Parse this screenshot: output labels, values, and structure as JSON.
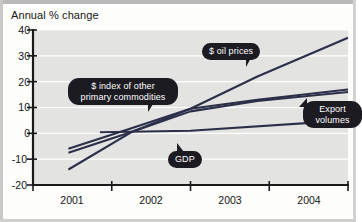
{
  "figure": {
    "title": "Annual % change"
  },
  "chart_data": {
    "type": "line",
    "title": "Annual % change",
    "xlabel": "",
    "ylabel": "Annual % change",
    "ylim": [
      -20,
      40
    ],
    "yticks": [
      -20,
      -10,
      0,
      10,
      20,
      30,
      40
    ],
    "ytick_labels": [
      "-20",
      "-10",
      "0",
      "10",
      "20",
      "30",
      "40"
    ],
    "xlim": [
      2000.75,
      2004.75
    ],
    "xticks": [
      2000.75,
      2001.75,
      2002.75,
      2003.75,
      2004.75
    ],
    "categories": [
      "2001",
      "2002",
      "2003",
      "2004"
    ],
    "xtick_labels": [
      "2001",
      "2002",
      "2003",
      "2004"
    ],
    "grid": true,
    "grid_orientation": "horizontal",
    "legend": "callout-labels",
    "series": [
      {
        "name": "$ oil prices",
        "color": "#2b2f4a",
        "x": [
          2001.2,
          2002.0,
          2002.75,
          2003.6,
          2004.75
        ],
        "values": [
          -14.0,
          0.5,
          9.5,
          22.0,
          37.0
        ]
      },
      {
        "name": "$ index of other primary commodities",
        "color": "#2b2f4a",
        "x": [
          2001.2,
          2002.0,
          2002.75,
          2003.6,
          2004.75
        ],
        "values": [
          -6.0,
          2.0,
          9.5,
          13.0,
          17.0
        ]
      },
      {
        "name": "Export volumes",
        "color": "#2b2f4a",
        "x": [
          2001.2,
          2002.0,
          2002.75,
          2003.6,
          2004.75
        ],
        "values": [
          -7.5,
          0.5,
          8.5,
          12.5,
          16.0
        ]
      },
      {
        "name": "GDP",
        "color": "#2b2f4a",
        "x": [
          2001.6,
          2002.75,
          2004.75
        ],
        "values": [
          0.4,
          1.0,
          5.0
        ]
      }
    ],
    "annotations": [
      {
        "label": "$ oil prices",
        "target_x": 2003.0,
        "target_y": 14.0
      },
      {
        "label": "$ index of other primary commodities",
        "target_x": 2002.15,
        "target_y": 10.0
      },
      {
        "label": "Export volumes",
        "target_x": 2003.95,
        "target_y": 13.0
      },
      {
        "label": "GDP",
        "target_x": 2002.85,
        "target_y": 3.0
      }
    ]
  },
  "callouts": {
    "oil": "$ oil prices",
    "commodities_line1": "$ index of other",
    "commodities_line2": "primary commodities",
    "exports_line1": "Export",
    "exports_line2": "volumes",
    "gdp": "GDP"
  },
  "axis": {
    "y_labels": [
      "40",
      "30",
      "20",
      "10",
      "0",
      "-10",
      "-20"
    ],
    "x_labels": [
      "2001",
      "2002",
      "2003",
      "2004"
    ]
  },
  "colors": {
    "line": "#2b2f4a",
    "plot_bg": "#e3e3e1",
    "page_bg": "#fdfdfb",
    "axis": "#1a1a1a",
    "grid": "#ffffff",
    "callout_bg": "#1c1b22",
    "callout_text": "#ffffff"
  }
}
